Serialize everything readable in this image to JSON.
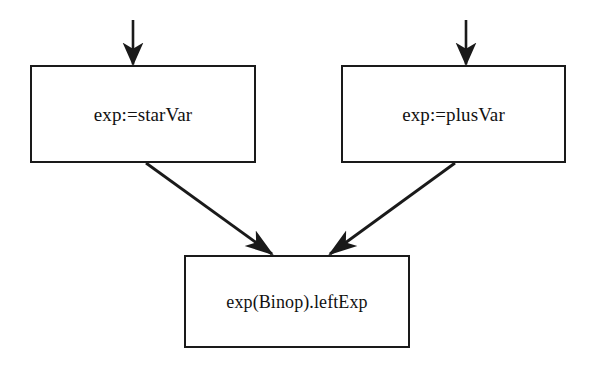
{
  "diagram": {
    "background_color": "#ffffff",
    "stroke_color": "#1a1a1a",
    "nodes": [
      {
        "id": "star-var",
        "label": "exp:=starVar",
        "x": 30,
        "y": 65,
        "width": 226,
        "height": 98
      },
      {
        "id": "plus-var",
        "label": "exp:=plusVar",
        "x": 341,
        "y": 65,
        "width": 225,
        "height": 98
      },
      {
        "id": "left-exp",
        "label": "exp(Binop).leftExp",
        "x": 184,
        "y": 255,
        "width": 226,
        "height": 93
      }
    ],
    "edges": [
      {
        "id": "incoming-star-var",
        "kind": "vertical-arrow",
        "from": [
          133,
          20
        ],
        "to": [
          133,
          65
        ],
        "target": "star-var"
      },
      {
        "id": "incoming-plus-var",
        "kind": "vertical-arrow",
        "from": [
          466,
          20
        ],
        "to": [
          466,
          65
        ],
        "target": "plus-var"
      },
      {
        "id": "star-var-to-left-exp",
        "kind": "diagonal-arrow",
        "from": [
          146,
          163
        ],
        "to": [
          272,
          254
        ],
        "source": "star-var",
        "target": "left-exp"
      },
      {
        "id": "plus-var-to-left-exp",
        "kind": "diagonal-arrow",
        "from": [
          455,
          163
        ],
        "to": [
          330,
          254
        ],
        "source": "plus-var",
        "target": "left-exp"
      }
    ]
  }
}
